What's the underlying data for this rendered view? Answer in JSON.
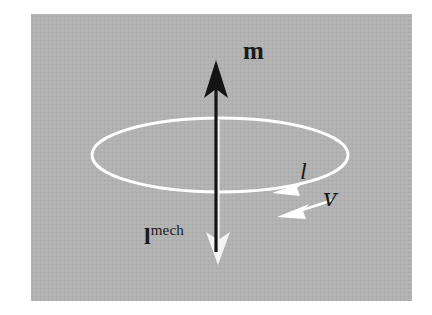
{
  "figure": {
    "kind": "physics-vector-diagram",
    "background_color": "#ffffff",
    "panel": {
      "fill_color": "#b0b0b0",
      "x": 31,
      "y": 14,
      "width": 381,
      "height": 287
    },
    "loop": {
      "name": "current-loop-ellipse",
      "stroke_color": "#ffffff",
      "stroke_width": 3,
      "center_x": 220,
      "center_y": 155,
      "radius_x": 128,
      "radius_y": 37
    },
    "vectors": [
      {
        "id": "magnetic-moment",
        "label": "m",
        "label_style": "bold-upright",
        "color": "#111111",
        "direction": "up",
        "from_x": 216,
        "from_y": 252,
        "to_x": 216,
        "to_y": 63
      },
      {
        "id": "mechanical-angular-momentum",
        "label_base": "l",
        "label_superscript": "mech",
        "label_style": "bold-upright-with-superscript",
        "color": "#f2f2f2",
        "direction": "down",
        "from_x": 218,
        "from_y": 120,
        "to_x": 218,
        "to_y": 262
      },
      {
        "id": "current",
        "label": "l",
        "label_style": "italic",
        "color": "#ffffff",
        "direction": "clockwise-along-loop",
        "arrowhead_x": 275,
        "arrowhead_y": 191
      },
      {
        "id": "velocity",
        "label": "v",
        "label_style": "italic-script",
        "color": "#ffffff",
        "direction": "down-left",
        "from_x": 333,
        "from_y": 199,
        "to_x": 279,
        "to_y": 216
      }
    ],
    "labels": {
      "magnetic_moment": "m",
      "angular_momentum_base": "l",
      "angular_momentum_superscript": "mech",
      "current": "l",
      "velocity": "ᴠ"
    }
  }
}
